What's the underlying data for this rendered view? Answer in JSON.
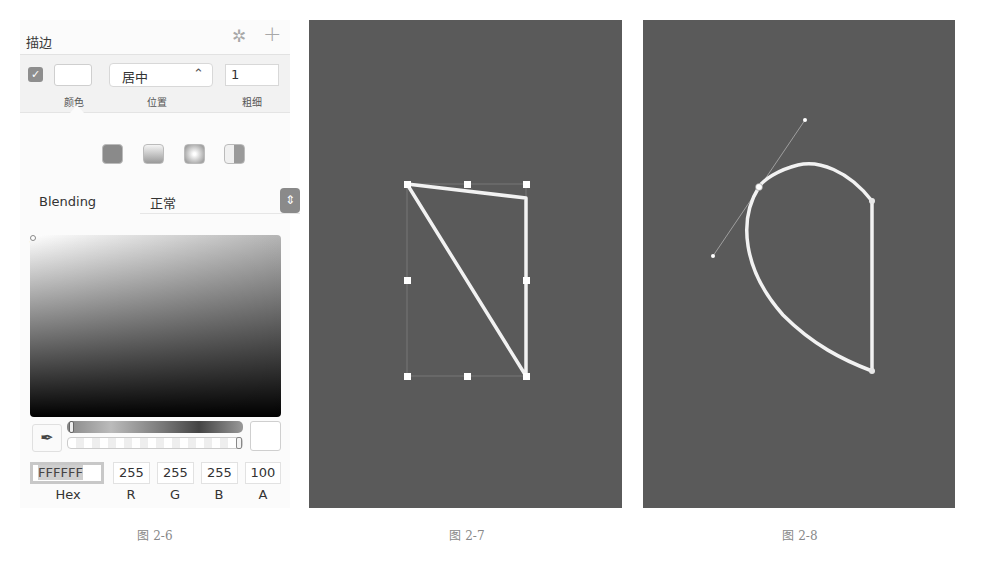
{
  "panel": {
    "section_title": "描边",
    "icons": {
      "settings": "gear-icon",
      "add": "plus-icon"
    },
    "gear_glyph": "✲",
    "plus_glyph": "+",
    "stroke": {
      "enabled": true,
      "check_glyph": "✓",
      "color": "#FFFFFF",
      "position_value": "居中",
      "position_chevron": "⌃⌄",
      "thickness_value": "1",
      "labels": {
        "color": "颜色",
        "position": "位置",
        "thickness": "粗细"
      }
    },
    "fill_types": [
      "solid",
      "linear-gradient",
      "radial-gradient",
      "angular-gradient"
    ],
    "blending": {
      "label": "Blending",
      "value": "正常",
      "stepper_glyph": "⌃⌄"
    },
    "color_picker": {
      "title": "拾色器",
      "toggle_glyph": "▼",
      "eyedropper_glyph": "✒",
      "hex_label": "Hex",
      "hex_value": "FFFFFF",
      "r_label": "R",
      "r_value": "255",
      "g_label": "G",
      "g_value": "255",
      "b_label": "B",
      "b_value": "255",
      "a_label": "A",
      "a_value": "100"
    }
  },
  "captions": {
    "fig1": "图 2-6",
    "fig2": "图 2-7",
    "fig3": "图 2-8"
  },
  "colors": {
    "canvas_bg": "#5a5a5a",
    "stroke": "#f2f2f2",
    "handle": "#ffffff",
    "panel_bg": "#fbfbfb"
  },
  "figure_2_7": {
    "description": "Straight-line path with bounding box handles",
    "path_points": [
      [
        98,
        164
      ],
      [
        217,
        178
      ],
      [
        217,
        356
      ],
      [
        98,
        164
      ]
    ],
    "bbox": {
      "x": 98,
      "y": 164,
      "w": 119,
      "h": 192
    }
  },
  "figure_2_8": {
    "description": "Curved path with bezier control handle",
    "anchor_points": [
      [
        116,
        167
      ],
      [
        229,
        181
      ],
      [
        229,
        351
      ]
    ],
    "control_handle": {
      "p1": [
        70,
        236
      ],
      "p2": [
        162,
        100
      ]
    }
  }
}
